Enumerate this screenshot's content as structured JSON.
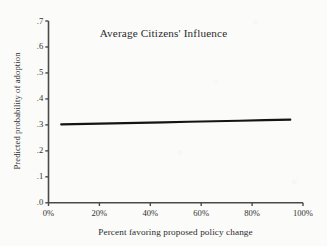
{
  "figure": {
    "background_color": "#fbfbfa",
    "axis_color": "#4a4a4a",
    "line_color": "#141414",
    "text_color": "#2b2b2b"
  },
  "chart_data": {
    "type": "line",
    "title": "Average Citizens' Influence",
    "xlabel": "Percent favoring proposed policy change",
    "ylabel": "Predicted probability of adoption",
    "xlim": [
      0,
      100
    ],
    "ylim": [
      0,
      0.7
    ],
    "grid": false,
    "legend": null,
    "xticks": [
      0,
      20,
      40,
      60,
      80,
      100
    ],
    "xtick_labels": [
      "0%",
      "20%",
      "40%",
      "60%",
      "80%",
      "100%"
    ],
    "yticks": [
      0,
      0.1,
      0.2,
      0.3,
      0.4,
      0.5,
      0.6,
      0.7
    ],
    "ytick_labels": [
      ".0",
      ".1",
      ".2",
      ".3",
      ".4",
      ".5",
      ".6",
      ".7"
    ],
    "series": [
      {
        "name": "Predicted probability of adoption",
        "x": [
          5,
          15,
          25,
          35,
          45,
          55,
          65,
          75,
          85,
          95
        ],
        "values": [
          0.302,
          0.304,
          0.306,
          0.308,
          0.31,
          0.312,
          0.314,
          0.316,
          0.318,
          0.32
        ]
      }
    ],
    "annotations": []
  }
}
